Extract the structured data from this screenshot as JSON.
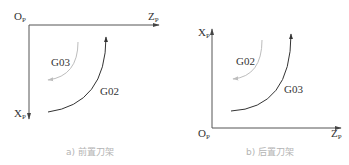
{
  "colors": {
    "axis": "#555555",
    "arc_dark": "#333333",
    "arc_light": "#bdbdbd",
    "caption": "#b4b4b4"
  },
  "diagrams": [
    {
      "id": "front",
      "origin_label": "O",
      "origin_sub": "P",
      "z_label": "Z",
      "z_sub": "P",
      "x_label": "X",
      "x_sub": "P",
      "x_direction": "down",
      "light_arc_label": "G03",
      "dark_arc_label": "G02",
      "caption": "a) 前置刀架"
    },
    {
      "id": "rear",
      "origin_label": "O",
      "origin_sub": "P",
      "z_label": "Z",
      "z_sub": "P",
      "x_label": "X",
      "x_sub": "P",
      "x_direction": "up",
      "light_arc_label": "G02",
      "dark_arc_label": "G03",
      "caption": "b) 后置刀架"
    }
  ]
}
